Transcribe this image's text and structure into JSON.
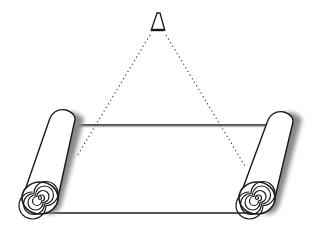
{
  "diagram": {
    "colors": {
      "stroke": "#1a1a1a",
      "shadow": "#9a9a9a",
      "fill": "#ffffff",
      "background": "#ffffff"
    },
    "elements": [
      {
        "id": "apex-eye",
        "label": ""
      },
      {
        "id": "left-sight-line",
        "style": "dotted"
      },
      {
        "id": "right-sight-line",
        "style": "dotted"
      },
      {
        "id": "sheet",
        "style": "solid"
      },
      {
        "id": "left-roller",
        "has_spiral": true
      },
      {
        "id": "right-roller",
        "has_spiral": true
      }
    ]
  }
}
